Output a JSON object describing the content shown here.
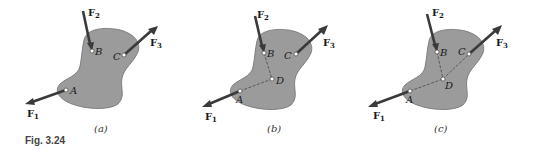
{
  "figure": {
    "label": "Fig. 3.24",
    "colors": {
      "body_fill": "#9b9b9b",
      "force_arrow": "#3a3a3a",
      "background": "#ffffff"
    },
    "panels": [
      {
        "id": "a",
        "caption": "(a)",
        "points": {
          "A": "A",
          "B": "B",
          "C": "C"
        },
        "forces": {
          "F1": "F",
          "F1_sub": "1",
          "F2": "F",
          "F2_sub": "2",
          "F3": "F",
          "F3_sub": "3"
        }
      },
      {
        "id": "b",
        "caption": "(b)",
        "points": {
          "A": "A",
          "B": "B",
          "C": "C",
          "D": "D"
        },
        "forces": {
          "F1": "F",
          "F1_sub": "1",
          "F2": "F",
          "F2_sub": "2",
          "F3": "F",
          "F3_sub": "3"
        }
      },
      {
        "id": "c",
        "caption": "(c)",
        "points": {
          "A": "A",
          "B": "B",
          "C": "C",
          "D": "D"
        },
        "forces": {
          "F1": "F",
          "F1_sub": "1",
          "F2": "F",
          "F2_sub": "2",
          "F3": "F",
          "F3_sub": "3"
        }
      }
    ]
  }
}
